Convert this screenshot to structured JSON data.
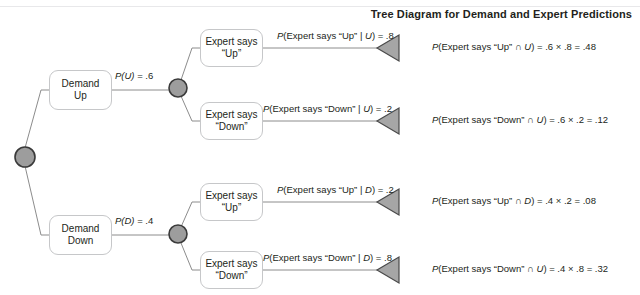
{
  "title": "Tree Diagram for Demand and Expert Predictions",
  "colors": {
    "node_fill": "#9d9d9d",
    "node_stroke": "#3a3a3a",
    "box_border": "#c6c7c9",
    "line": "#8c8c8c",
    "triangle_fill": "#a6a6a6",
    "triangle_stroke": "#4a4a4a",
    "text": "#231f20",
    "background": "#ffffff"
  },
  "nodes": {
    "root": "root-node",
    "demand_up_box": {
      "line1": "Demand",
      "line2": "Up"
    },
    "demand_down_box": {
      "line1": "Demand",
      "line2": "Down"
    },
    "expert_up_1": {
      "line1": "Expert says",
      "line2": "“Up”"
    },
    "expert_down_1": {
      "line1": "Expert says",
      "line2": "“Down”"
    },
    "expert_up_2": {
      "line1": "Expert says",
      "line2": "“Up”"
    },
    "expert_down_2": {
      "line1": "Expert says",
      "line2": "“Down”"
    }
  },
  "edge_labels": {
    "demand_up": {
      "p": "P",
      "var": "(U)",
      "rest": " = .6"
    },
    "demand_down": {
      "p": "P",
      "var": "(D)",
      "rest": " = .4"
    }
  },
  "branches": [
    {
      "id": "up-up",
      "conditional": {
        "prefix": "P",
        "open": "(Expert says “Up” | ",
        "var": "U",
        "close": ") = .8"
      },
      "joint": {
        "prefix": "P",
        "open": "(Expert says “Up” ∩ ",
        "var": "U",
        "close": ") = .6 × .8 = .48"
      }
    },
    {
      "id": "up-down",
      "conditional": {
        "prefix": "P",
        "open": "(Expert says “Down” | ",
        "var": "U",
        "close": ") = .2"
      },
      "joint": {
        "prefix": "P",
        "open": "(Expert says “Down” ∩ ",
        "var": "U",
        "close": ") = .6 × .2 = .12"
      }
    },
    {
      "id": "down-up",
      "conditional": {
        "prefix": "P",
        "open": "(Expert says “Up” | ",
        "var": "D",
        "close": ") = .2"
      },
      "joint": {
        "prefix": "P",
        "open": "(Expert says “Up” ∩ ",
        "var": "D",
        "close": ") = .4 × .2 = .08"
      }
    },
    {
      "id": "down-down",
      "conditional": {
        "prefix": "P",
        "open": "(Expert says “Down” | ",
        "var": "D",
        "close": ") = .8"
      },
      "joint": {
        "prefix": "P",
        "open": "(Expert says “Down” ∩ ",
        "var": "U",
        "close": ") = .4 × .8 = .32"
      }
    }
  ]
}
